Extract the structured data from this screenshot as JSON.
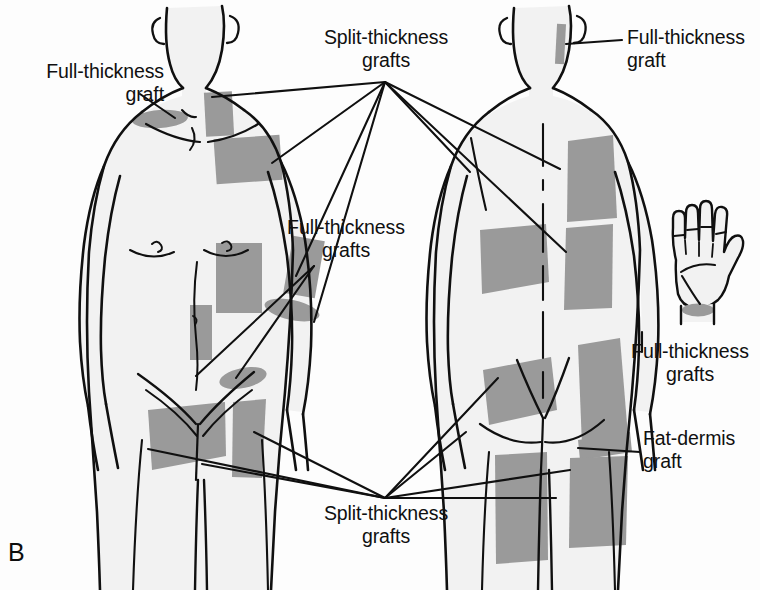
{
  "figure": {
    "panel_letter": "B",
    "alt_title": "Skin graft donor sites, anterior and posterior views",
    "background_color": "#fdfdfd",
    "body_fill_color": "#f2f2f2",
    "graft_fill_color": "#9a9a9a",
    "outline_color": "#101010",
    "leader_line_color": "#101010",
    "text_color": "#101010"
  },
  "labels": [
    {
      "id": "full-thickness-graft-left",
      "text": "Full-thickness\ngraft",
      "align": "right",
      "x": 6,
      "y": 60,
      "width": 158
    },
    {
      "id": "split-thickness-grafts-top",
      "text": "Split-thickness\ngrafts",
      "align": "center",
      "x": 300,
      "y": 26,
      "width": 172
    },
    {
      "id": "full-thickness-graft-top-right",
      "text": "Full-thickness\ngraft",
      "align": "left",
      "x": 627,
      "y": 26,
      "width": 133
    },
    {
      "id": "full-thickness-grafts-middle",
      "text": "Full-thickness\ngrafts",
      "align": "center",
      "x": 262,
      "y": 216,
      "width": 168
    },
    {
      "id": "full-thickness-grafts-right",
      "text": "Full-thickness\ngrafts",
      "align": "center",
      "x": 620,
      "y": 340,
      "width": 140
    },
    {
      "id": "fat-dermis-graft-right",
      "text": "Fat-dermis\ngraft",
      "align": "left",
      "x": 643,
      "y": 427,
      "width": 117
    },
    {
      "id": "split-thickness-grafts-bottom",
      "text": "Split-thickness\ngrafts",
      "align": "center",
      "x": 300,
      "y": 502,
      "width": 172
    }
  ],
  "anatomy": {
    "anterior_view": {
      "name": "anterior-body-view",
      "description": "Front view of male torso, head to mid-thigh"
    },
    "posterior_view": {
      "name": "posterior-body-view",
      "description": "Back view of male torso, head to mid-thigh with spinal midline"
    },
    "hand_inset": {
      "name": "hand-palm-inset",
      "description": "Palm-up right hand with shaded donor area at wrist"
    }
  },
  "graft_sites": {
    "anterior": [
      {
        "name": "supraclavicular-graft",
        "type": "full-thickness"
      },
      {
        "name": "lateral-neck-graft",
        "type": "split-thickness"
      },
      {
        "name": "upper-chest-graft",
        "type": "split-thickness"
      },
      {
        "name": "abdominal-graft",
        "type": "split-thickness"
      },
      {
        "name": "lower-abdominal-graft",
        "type": "split-thickness"
      },
      {
        "name": "antecubital-graft",
        "type": "full-thickness"
      },
      {
        "name": "volar-forearm-graft",
        "type": "full-thickness"
      },
      {
        "name": "inguinal-graft",
        "type": "full-thickness"
      },
      {
        "name": "anterior-thigh-graft-left",
        "type": "split-thickness"
      },
      {
        "name": "anterior-thigh-graft-right",
        "type": "split-thickness"
      }
    ],
    "posterior": [
      {
        "name": "postauricular-graft",
        "type": "full-thickness"
      },
      {
        "name": "upper-back-graft",
        "type": "split-thickness"
      },
      {
        "name": "mid-back-graft",
        "type": "split-thickness"
      },
      {
        "name": "flank-graft",
        "type": "split-thickness"
      },
      {
        "name": "buttock-graft-left",
        "type": "split-thickness"
      },
      {
        "name": "buttock-graft-right",
        "type": "full-thickness"
      },
      {
        "name": "gluteal-crease-graft",
        "type": "fat-dermis"
      },
      {
        "name": "posterior-thigh-graft-left",
        "type": "split-thickness"
      },
      {
        "name": "posterior-thigh-graft-right",
        "type": "split-thickness"
      }
    ],
    "hand": [
      {
        "name": "wrist-crease-graft",
        "type": "full-thickness"
      }
    ]
  },
  "leader_lines": {
    "top_fan_origin": {
      "x": 385,
      "y": 82
    },
    "bottom_fan_origin": {
      "x": 385,
      "y": 498
    },
    "top_fan_targets": [
      {
        "x": 213,
        "y": 97
      },
      {
        "x": 290,
        "y": 160
      },
      {
        "x": 300,
        "y": 272
      },
      {
        "x": 318,
        "y": 320
      },
      {
        "x": 470,
        "y": 170
      },
      {
        "x": 558,
        "y": 168
      },
      {
        "x": 566,
        "y": 250
      }
    ],
    "bottom_fan_targets": [
      {
        "x": 150,
        "y": 448
      },
      {
        "x": 205,
        "y": 462
      },
      {
        "x": 272,
        "y": 430
      },
      {
        "x": 466,
        "y": 430
      },
      {
        "x": 495,
        "y": 378
      },
      {
        "x": 565,
        "y": 468
      },
      {
        "x": 545,
        "y": 498
      }
    ]
  }
}
